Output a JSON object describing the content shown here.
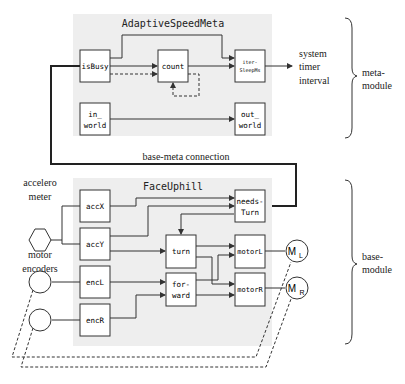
{
  "meta_module": {
    "title": "AdaptiveSpeedMeta",
    "blocks": {
      "isBusy": "isBusy",
      "count": "count",
      "iterSleepMs_1": "iter-",
      "iterSleepMs_2": "SleepMs",
      "in_world_1": "in_",
      "in_world_2": "world",
      "out_world_1": "out_",
      "out_world_2": "world"
    },
    "output_label": [
      "system",
      "timer",
      "interval"
    ],
    "brace_label": [
      "meta-",
      "module"
    ]
  },
  "connection": {
    "label": "base-meta connection"
  },
  "base_module": {
    "title": "FaceUphill",
    "blocks": {
      "accX": "accX",
      "accY": "accY",
      "needsTurn_1": "needs-",
      "needsTurn_2": "Turn",
      "turn": "turn",
      "motorL": "motorL",
      "encL": "encL",
      "encR": "encR",
      "forward_1": "for-",
      "forward_2": "ward",
      "motorR": "motorR"
    },
    "sensors": {
      "accelerometer": [
        "accelero",
        "meter"
      ],
      "encoders": [
        "motor",
        "encoders"
      ]
    },
    "motors": {
      "left": "M",
      "left_sub": "L",
      "right": "M",
      "right_sub": "R"
    },
    "brace_label": [
      "base-",
      "module"
    ]
  },
  "colors": {
    "panel": "#eeeeee",
    "line": "#333333",
    "box_fill": "#ffffff"
  }
}
